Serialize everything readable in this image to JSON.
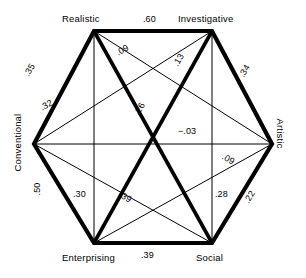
{
  "figure": {
    "type": "hexagon-correlation-diagram",
    "vertices": [
      {
        "id": "realistic",
        "label": "Realistic",
        "x": 94,
        "y": 31
      },
      {
        "id": "investigative",
        "label": "Investigative",
        "x": 212,
        "y": 31
      },
      {
        "id": "artistic",
        "label": "Artistic",
        "x": 272,
        "y": 144
      },
      {
        "id": "social",
        "label": "Social",
        "x": 212,
        "y": 243
      },
      {
        "id": "enterprising",
        "label": "Enterprising",
        "x": 94,
        "y": 243
      },
      {
        "id": "conventional",
        "label": "Conventional",
        "x": 34,
        "y": 144
      }
    ],
    "edges": [
      {
        "from": "realistic",
        "to": "investigative",
        "value": ".60",
        "weight": "thick"
      },
      {
        "from": "investigative",
        "to": "artistic",
        "value": ".34",
        "weight": "thick"
      },
      {
        "from": "artistic",
        "to": "social",
        "value": ".22",
        "weight": "thick"
      },
      {
        "from": "social",
        "to": "enterprising",
        "value": ".39",
        "weight": "thick"
      },
      {
        "from": "enterprising",
        "to": "conventional",
        "value": ".50",
        "weight": "thick"
      },
      {
        "from": "conventional",
        "to": "realistic",
        "value": ".35",
        "weight": "thick"
      },
      {
        "from": "realistic",
        "to": "social",
        "value": ".26",
        "weight": "thick"
      },
      {
        "from": "investigative",
        "to": "enterprising",
        "value": ".13",
        "weight": "thick"
      },
      {
        "from": "realistic",
        "to": "artistic",
        "value": ".09",
        "weight": "thin"
      },
      {
        "from": "investigative",
        "to": "conventional",
        "value": ".32",
        "weight": "thin"
      },
      {
        "from": "conventional",
        "to": "social",
        "value": ".09",
        "weight": "thin"
      },
      {
        "from": "artistic",
        "to": "enterprising",
        "value": ".39",
        "weight": "thin"
      },
      {
        "from": "realistic",
        "to": "enterprising",
        "value": ".30",
        "weight": "thin"
      },
      {
        "from": "investigative",
        "to": "social",
        "value": ".28",
        "weight": "thin"
      },
      {
        "from": "conventional",
        "to": "artistic",
        "value": "−.03",
        "weight": "thin"
      }
    ],
    "labels": {
      "realistic": "Realistic",
      "investigative": "Investigative",
      "artistic": "Artistic",
      "social": "Social",
      "enterprising": "Enterprising",
      "conventional": "Conventional"
    },
    "values": {
      "realistic_investigative": ".60",
      "investigative_artistic": ".34",
      "artistic_social": ".22",
      "social_enterprising": ".39",
      "enterprising_conventional": ".50",
      "conventional_realistic": ".35",
      "realistic_social": ".26",
      "investigative_enterprising": ".13",
      "realistic_artistic": ".09",
      "investigative_conventional": ".32",
      "conventional_social": ".09",
      "artistic_enterprising": ".39",
      "realistic_enterprising": ".30",
      "investigative_social": ".28",
      "conventional_artistic": "−.03"
    },
    "colors": {
      "line": "#000000",
      "text": "#000000",
      "background": "#ffffff"
    }
  }
}
